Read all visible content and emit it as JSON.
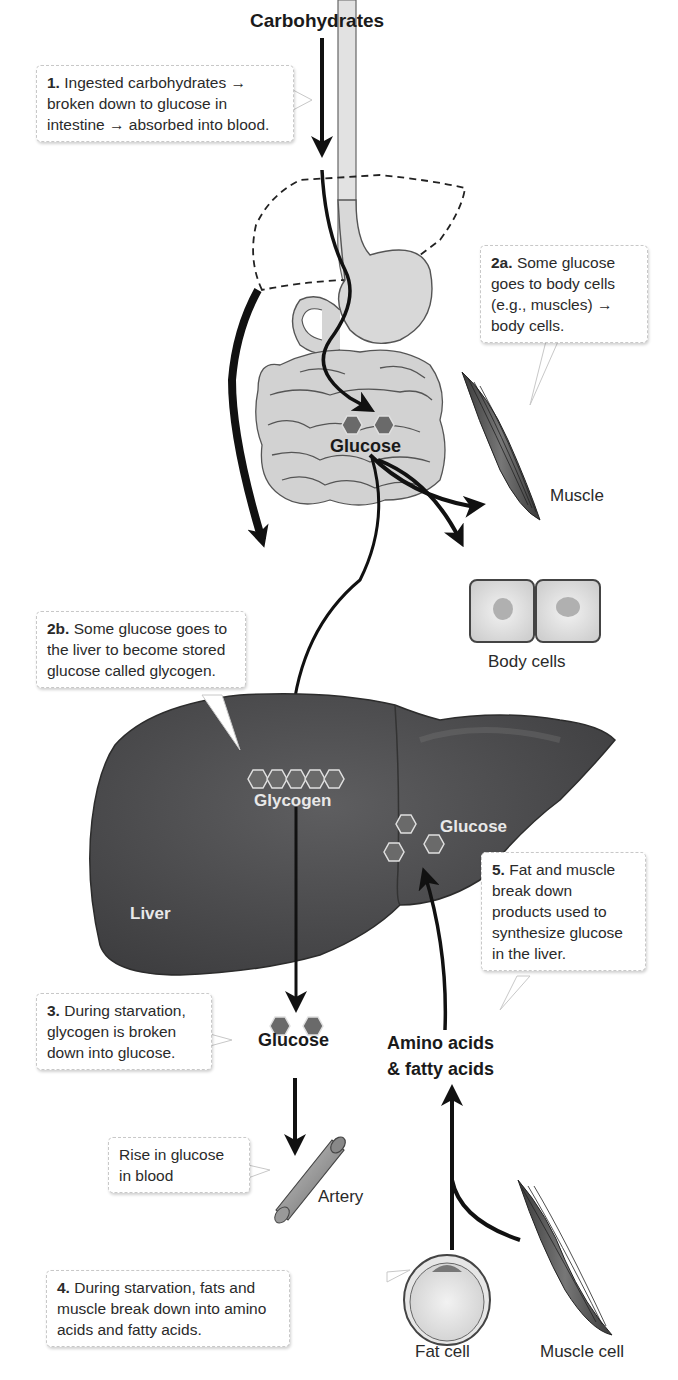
{
  "title": "Carbohydrates",
  "callouts": {
    "step1": {
      "num": "1.",
      "text": "Ingested carbohydrates → broken down to glucose in intestine → absorbed into blood."
    },
    "step2a": {
      "num": "2a.",
      "text": "Some glucose goes to body cells (e.g., muscles) → body cells."
    },
    "step2b": {
      "num": "2b.",
      "text": "Some glucose goes to the liver to become stored glucose called glycogen."
    },
    "step3": {
      "num": "3.",
      "text": "During starvation, glycogen is broken down into glucose."
    },
    "step4": {
      "num": "4.",
      "text": "During starvation, fats and  muscle break down into amino acids and fatty acids."
    },
    "step5": {
      "num": "5.",
      "text": "Fat and muscle break down products used to synthesize glucose in the liver."
    },
    "rise": {
      "text": "Rise in glucose in blood"
    }
  },
  "labels": {
    "glucose_intestine": "Glucose",
    "muscle": "Muscle",
    "body_cells": "Body cells",
    "glycogen": "Glycogen",
    "glucose_liver": "Glucose",
    "liver": "Liver",
    "glucose_released": "Glucose",
    "amino_acids_line1": "Amino acids",
    "amino_acids_line2": "& fatty acids",
    "artery": "Artery",
    "fat_cell": "Fat cell",
    "muscle_cell": "Muscle cell"
  },
  "colors": {
    "liver": "#4e4e50",
    "organ_fill": "#d4d4d4",
    "arrow": "#111111",
    "hexagon": "#6a6a6a",
    "callout_border": "#c8c8c8"
  }
}
